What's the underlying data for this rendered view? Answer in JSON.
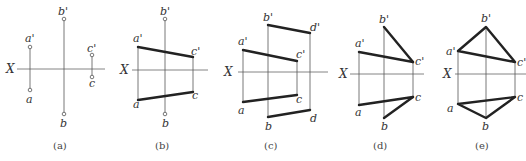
{
  "axis_label": "X",
  "panels": [
    {
      "id": "a",
      "caption": "(a)",
      "points": {
        "a_prime": "a'",
        "a": "a",
        "b_prime": "b'",
        "b": "b",
        "c_prime": "c'",
        "c": "c"
      }
    },
    {
      "id": "b",
      "caption": "(b)",
      "points": {
        "a_prime": "a'",
        "a": "a",
        "b_prime": "b'",
        "b": "b",
        "c_prime": "c'",
        "c": "c"
      }
    },
    {
      "id": "c",
      "caption": "(c)",
      "points": {
        "a_prime": "a'",
        "a": "a",
        "b_prime": "b'",
        "b": "b",
        "c_prime": "c'",
        "c": "c",
        "d_prime": "d'",
        "d": "d"
      }
    },
    {
      "id": "d",
      "caption": "(d)",
      "points": {
        "a_prime": "a'",
        "a": "a",
        "b_prime": "b'",
        "b": "b",
        "c_prime": "c'",
        "c": "c"
      }
    },
    {
      "id": "e",
      "caption": "(e)",
      "points": {
        "a_prime": "a'",
        "a": "a",
        "b_prime": "b'",
        "b": "b",
        "c_prime": "c'",
        "c": "c"
      }
    }
  ]
}
